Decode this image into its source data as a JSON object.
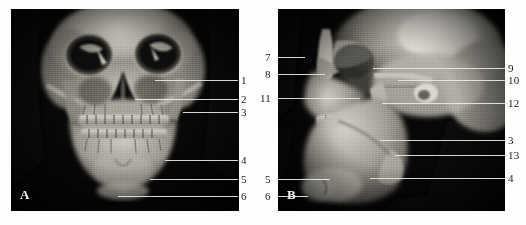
{
  "figure": {
    "background_color": "#fdfdfb",
    "image_background_color": "#070707",
    "leader_line_color": "#e9e9e4",
    "label_color": "#1b1b1b"
  },
  "panels": [
    {
      "id": "panel-a",
      "letter": "A",
      "view": "frontal 3D CT volume rendering of skull",
      "labels_side": "right",
      "callouts": [
        {
          "number": "1",
          "x": 241,
          "y": 76,
          "line_x1": 155,
          "line_x2": 238,
          "line_y": 80
        },
        {
          "number": "2",
          "x": 241,
          "y": 95,
          "line_x1": 135,
          "line_x2": 238,
          "line_y": 99
        },
        {
          "number": "3",
          "x": 241,
          "y": 108,
          "line_x1": 183,
          "line_x2": 238,
          "line_y": 112
        },
        {
          "number": "4",
          "x": 241,
          "y": 156,
          "line_x1": 165,
          "line_x2": 238,
          "line_y": 160
        },
        {
          "number": "5",
          "x": 241,
          "y": 175,
          "line_x1": 150,
          "line_x2": 238,
          "line_y": 179
        },
        {
          "number": "6",
          "x": 241,
          "y": 192,
          "line_x1": 118,
          "line_x2": 238,
          "line_y": 196
        }
      ]
    },
    {
      "id": "panel-b",
      "letter": "B",
      "view": "lateral oblique 3D CT volume rendering of skull",
      "labels_side": "both",
      "callouts": [
        {
          "number": "7",
          "x": 265,
          "y": 53,
          "line_x1": 278,
          "line_x2": 305,
          "line_y": 57,
          "side": "left"
        },
        {
          "number": "8",
          "x": 265,
          "y": 70,
          "line_x1": 278,
          "line_x2": 325,
          "line_y": 74,
          "side": "left"
        },
        {
          "number": "11",
          "x": 261,
          "y": 94,
          "line_x1": 278,
          "line_x2": 360,
          "line_y": 98,
          "side": "left"
        },
        {
          "number": "5",
          "x": 265,
          "y": 175,
          "line_x1": 278,
          "line_x2": 330,
          "line_y": 179,
          "side": "left"
        },
        {
          "number": "6",
          "x": 265,
          "y": 192,
          "line_x1": 278,
          "line_x2": 308,
          "line_y": 196,
          "side": "left"
        },
        {
          "number": "9",
          "x": 508,
          "y": 64,
          "line_x1": 373,
          "line_x2": 505,
          "line_y": 68,
          "side": "right"
        },
        {
          "number": "10",
          "x": 508,
          "y": 76,
          "line_x1": 398,
          "line_x2": 505,
          "line_y": 80,
          "side": "right"
        },
        {
          "number": "12",
          "x": 508,
          "y": 99,
          "line_x1": 382,
          "line_x2": 505,
          "line_y": 103,
          "side": "right"
        },
        {
          "number": "3",
          "x": 508,
          "y": 136,
          "line_x1": 380,
          "line_x2": 505,
          "line_y": 140,
          "side": "right"
        },
        {
          "number": "13",
          "x": 508,
          "y": 151,
          "line_x1": 395,
          "line_x2": 505,
          "line_y": 155,
          "side": "right"
        },
        {
          "number": "4",
          "x": 508,
          "y": 174,
          "line_x1": 370,
          "line_x2": 505,
          "line_y": 178,
          "side": "right"
        }
      ]
    }
  ]
}
